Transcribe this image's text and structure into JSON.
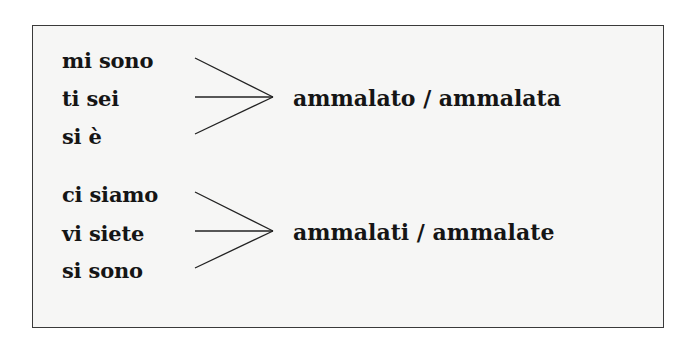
{
  "groups": [
    {
      "subjects": [
        "mi sono",
        "ti sei",
        "si è"
      ],
      "result": "ammalato / ammalata"
    },
    {
      "subjects": [
        "ci siamo",
        "vi siete",
        "si sono"
      ],
      "result": "ammalati / ammalate"
    }
  ]
}
